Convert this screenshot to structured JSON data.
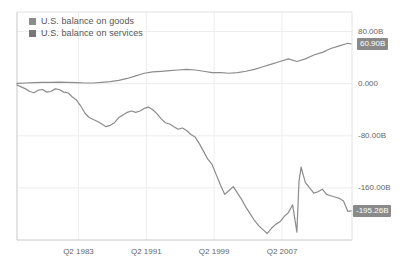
{
  "chart_data": {
    "type": "line",
    "title": "",
    "subtitle": "",
    "xlabel": "",
    "ylabel": "",
    "grid": true,
    "legend_position": "top-left",
    "ylim": [
      -240,
      110
    ],
    "yticks": [
      80,
      0,
      -80,
      -160
    ],
    "ytick_labels": [
      "80.00B",
      "0.000",
      "-80.00B",
      "-160.00B"
    ],
    "xlim": [
      1976.0,
      2015.5
    ],
    "xticks": [
      1983.25,
      1991.25,
      1999.25,
      2007.25
    ],
    "xtick_labels": [
      "Q2 1983",
      "Q2 1991",
      "Q2 1999",
      "Q2 2007"
    ],
    "end_value_labels": [
      {
        "series": "U.S. balance on services",
        "text": "60.90B",
        "value": 60.9
      },
      {
        "series": "U.S. balance on goods",
        "text": "-195.26B",
        "value": -195.26
      }
    ],
    "series": [
      {
        "name": "U.S. balance on goods",
        "color": "#8c8c8c",
        "x": [
          1976.0,
          1976.5,
          1977.0,
          1977.5,
          1978.0,
          1978.5,
          1979.0,
          1979.5,
          1980.0,
          1980.5,
          1981.0,
          1981.5,
          1982.0,
          1982.5,
          1983.0,
          1983.5,
          1984.0,
          1984.5,
          1985.0,
          1985.5,
          1986.0,
          1986.5,
          1987.0,
          1987.5,
          1988.0,
          1988.5,
          1989.0,
          1989.5,
          1990.0,
          1990.5,
          1991.0,
          1991.5,
          1992.0,
          1992.5,
          1993.0,
          1993.5,
          1994.0,
          1994.5,
          1995.0,
          1995.5,
          1996.0,
          1996.5,
          1997.0,
          1997.5,
          1998.0,
          1998.5,
          1999.0,
          1999.5,
          2000.0,
          2000.5,
          2001.0,
          2001.5,
          2002.0,
          2002.5,
          2003.0,
          2003.5,
          2004.0,
          2004.5,
          2005.0,
          2005.5,
          2006.0,
          2006.5,
          2007.0,
          2007.5,
          2008.0,
          2008.5,
          2009.0,
          2009.25,
          2009.5,
          2009.75,
          2010.0,
          2010.5,
          2011.0,
          2011.5,
          2012.0,
          2012.5,
          2013.0,
          2013.5,
          2014.0,
          2014.5,
          2015.0,
          2015.4
        ],
        "values": [
          -2.0,
          -5.0,
          -8.0,
          -12.0,
          -14.0,
          -10.0,
          -9.0,
          -13.0,
          -12.0,
          -8.0,
          -9.0,
          -13.0,
          -14.0,
          -20.0,
          -25.0,
          -34.0,
          -45.0,
          -52.0,
          -55.0,
          -58.0,
          -62.0,
          -66.0,
          -64.0,
          -60.0,
          -52.0,
          -48.0,
          -44.0,
          -42.0,
          -44.0,
          -42.0,
          -38.0,
          -36.0,
          -40.0,
          -46.0,
          -54.0,
          -60.0,
          -62.0,
          -66.0,
          -70.0,
          -68.0,
          -72.0,
          -78.0,
          -82.0,
          -92.0,
          -104.0,
          -116.0,
          -124.0,
          -140.0,
          -156.0,
          -170.0,
          -164.0,
          -158.0,
          -168.0,
          -178.0,
          -190.0,
          -200.0,
          -210.0,
          -218.0,
          -224.0,
          -230.0,
          -222.0,
          -216.0,
          -212.0,
          -204.0,
          -198.0,
          -186.0,
          -228.0,
          -150.0,
          -128.0,
          -140.0,
          -152.0,
          -160.0,
          -168.0,
          -166.0,
          -162.0,
          -170.0,
          -172.0,
          -174.0,
          -176.0,
          -180.0,
          -196.0,
          -195.26
        ]
      },
      {
        "name": "U.S. balance on services",
        "color": "#8c8c8c",
        "x": [
          1976.0,
          1977.0,
          1978.0,
          1979.0,
          1980.0,
          1981.0,
          1982.0,
          1983.0,
          1984.0,
          1985.0,
          1986.0,
          1987.0,
          1988.0,
          1989.0,
          1990.0,
          1991.0,
          1992.0,
          1993.0,
          1994.0,
          1995.0,
          1996.0,
          1997.0,
          1998.0,
          1999.0,
          2000.0,
          2001.0,
          2002.0,
          2003.0,
          2004.0,
          2005.0,
          2006.0,
          2007.0,
          2008.0,
          2009.0,
          2010.0,
          2011.0,
          2012.0,
          2013.0,
          2014.0,
          2015.0,
          2015.4
        ],
        "values": [
          0.5,
          1.0,
          1.5,
          2.0,
          2.0,
          2.5,
          2.0,
          1.5,
          1.0,
          1.0,
          2.0,
          3.0,
          5.0,
          8.0,
          12.0,
          16.0,
          18.0,
          19.0,
          20.0,
          21.0,
          22.0,
          21.0,
          19.0,
          17.0,
          17.0,
          16.0,
          17.0,
          19.0,
          22.0,
          26.0,
          30.0,
          34.0,
          38.0,
          34.0,
          38.0,
          44.0,
          48.0,
          54.0,
          58.0,
          62.0,
          60.9
        ]
      }
    ]
  },
  "legend": {
    "items": [
      {
        "label": "U.S. balance on goods",
        "color": "#8c8c8c"
      },
      {
        "label": "U.S. balance on services",
        "color": "#777777"
      }
    ]
  },
  "axes": {
    "y_labels": [
      "80.00B",
      "0.000",
      "-80.00B",
      "-160.00B"
    ],
    "x_labels": [
      "Q2 1983",
      "Q2 1991",
      "Q2 1999",
      "Q2 2007"
    ]
  },
  "badges": {
    "upper": "60.90B",
    "lower": "-195.26B"
  },
  "colors": {
    "line": "#8c8c8c",
    "grid": "#ededed",
    "frame": "#c8c8c8",
    "badge_bg": "#8a8a8a",
    "text": "#666666"
  }
}
